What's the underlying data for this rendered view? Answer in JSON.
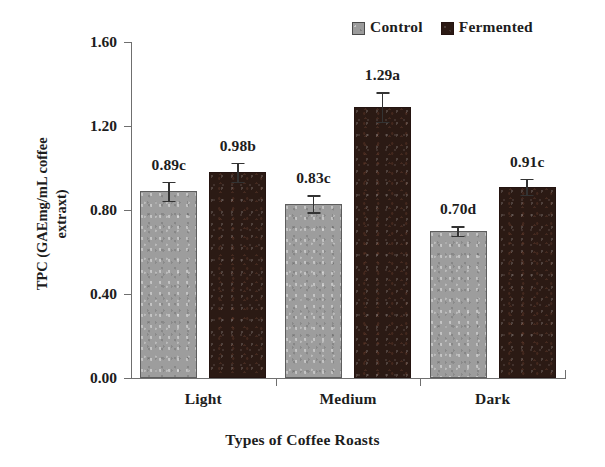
{
  "chart_data": {
    "type": "bar",
    "title": "",
    "xlabel": "Types of Coffee Roasts",
    "ylabel": "TPC (GAEmg/mL coffee extraxt)",
    "ylabel_line1": "TPC (GAEmg/mL coffee",
    "ylabel_line2": "extraxt)",
    "categories": [
      "Light",
      "Medium",
      "Dark"
    ],
    "ylim": [
      0.0,
      1.6
    ],
    "ytick_labels": [
      "0.00",
      "0.40",
      "0.80",
      "1.20",
      "1.60"
    ],
    "ytick_values": [
      0.0,
      0.4,
      0.8,
      1.2,
      1.6
    ],
    "grid": false,
    "legend_position": "top-right",
    "series": [
      {
        "name": "Control",
        "color": "#9d9d9d",
        "values": [
          0.89,
          0.83,
          0.7
        ],
        "errors": [
          0.045,
          0.04,
          0.022
        ],
        "labels": [
          "0.89c",
          "0.83c",
          "0.70d"
        ]
      },
      {
        "name": "Fermented",
        "color": "#2b1a14",
        "values": [
          0.98,
          1.29,
          0.91
        ],
        "errors": [
          0.045,
          0.07,
          0.038
        ],
        "labels": [
          "0.98b",
          "1.29a",
          "0.91c"
        ]
      }
    ]
  },
  "legend": {
    "items": [
      {
        "label": "Control",
        "swatch": "legend-swatch-control"
      },
      {
        "label": "Fermented",
        "swatch": "legend-swatch-fermented"
      }
    ]
  }
}
